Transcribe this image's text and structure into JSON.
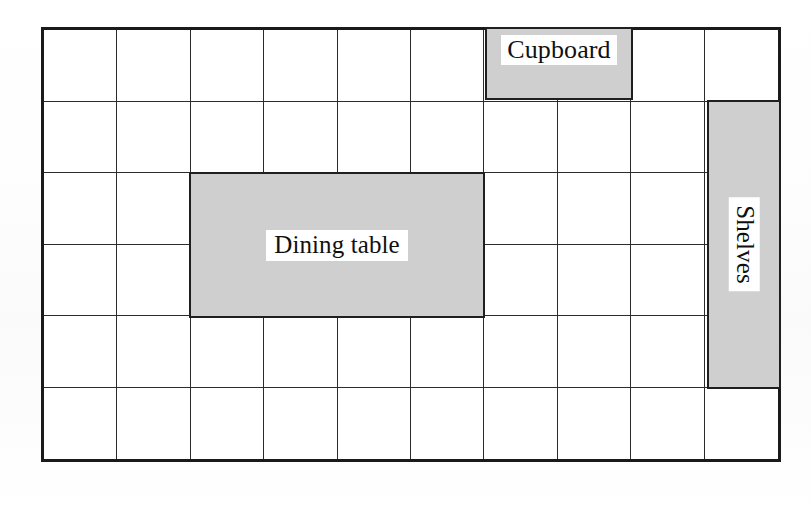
{
  "diagram": {
    "kind": "room-floor-plan-grid",
    "grid": {
      "columns": 10,
      "rows": 6,
      "cell_width_px": 74,
      "cell_height_px": 72.5,
      "outer_border_color": "#1a1a1a",
      "inner_line_color": "#2b2b2b",
      "cell_fill": "#ffffff"
    },
    "furniture_fill": "#cfcfcf",
    "furniture_border": "#1f1f1f",
    "label_background": "#ffffff",
    "label_color": "#101010",
    "items": [
      {
        "id": "cupboard",
        "label": "Cupboard",
        "col_start": 7,
        "col_span": 2,
        "row_start": 1,
        "row_span": 1,
        "orientation": "horizontal"
      },
      {
        "id": "dining-table",
        "label": "Dining table",
        "col_start": 3,
        "col_span": 4,
        "row_start": 3,
        "row_span": 2,
        "orientation": "horizontal"
      },
      {
        "id": "shelves",
        "label": "Shelves",
        "col_start": 10,
        "col_span": 1,
        "row_start": 2,
        "row_span": 4,
        "orientation": "vertical"
      }
    ]
  },
  "artifacts": {
    "bottom_right_ghost": "",
    "top_right_ghost": ""
  }
}
